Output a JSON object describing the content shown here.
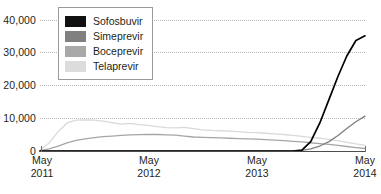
{
  "chart_data": {
    "type": "line",
    "title": "",
    "xlabel": "",
    "ylabel": "",
    "ylim": [
      0,
      44000
    ],
    "yticks": [
      0,
      10000,
      20000,
      30000,
      40000
    ],
    "ytick_labels": [
      "0",
      "10,000",
      "20,000",
      "30,000",
      "40,000"
    ],
    "grid": true,
    "xlim": [
      "May 2011",
      "May 2014"
    ],
    "xticks": [
      "May 2011",
      "May 2012",
      "May 2013",
      "May 2014"
    ],
    "xtick_labels": [
      {
        "month": "May",
        "year": "2011"
      },
      {
        "month": "May",
        "year": "2012"
      },
      {
        "month": "May",
        "year": "2013"
      },
      {
        "month": "May",
        "year": "2014"
      }
    ],
    "legend_position": "upper-left-inside",
    "x": [
      0,
      0.028,
      0.056,
      0.083,
      0.111,
      0.139,
      0.167,
      0.194,
      0.222,
      0.25,
      0.278,
      0.306,
      0.333,
      0.361,
      0.389,
      0.417,
      0.444,
      0.472,
      0.5,
      0.528,
      0.556,
      0.583,
      0.611,
      0.639,
      0.667,
      0.694,
      0.722,
      0.75,
      0.778,
      0.806,
      0.833,
      0.861,
      0.889,
      0.917,
      0.944,
      0.972,
      1.0
    ],
    "series": [
      {
        "name": "Sofosbuvir",
        "color": "#000000",
        "values": [
          0,
          0,
          0,
          0,
          0,
          0,
          0,
          0,
          0,
          0,
          0,
          0,
          0,
          0,
          0,
          0,
          0,
          0,
          0,
          0,
          0,
          0,
          0,
          0,
          0,
          0,
          0,
          0,
          0,
          300,
          3000,
          9000,
          16500,
          24000,
          30500,
          35500,
          37000
        ]
      },
      {
        "name": "Simeprevir",
        "color": "#7f7f7f",
        "values": [
          0,
          0,
          0,
          0,
          0,
          0,
          0,
          0,
          0,
          0,
          0,
          0,
          0,
          0,
          0,
          0,
          0,
          0,
          0,
          0,
          0,
          0,
          0,
          0,
          0,
          0,
          0,
          0,
          0,
          200,
          700,
          1600,
          3000,
          5000,
          7200,
          9400,
          11200
        ]
      },
      {
        "name": "Boceprevir",
        "color": "#a6a6a6",
        "values": [
          150,
          700,
          1600,
          2600,
          3400,
          3900,
          4300,
          4600,
          4800,
          5000,
          5150,
          5250,
          5300,
          5300,
          5200,
          5100,
          4800,
          4500,
          4400,
          4300,
          4200,
          4100,
          4000,
          3900,
          3800,
          3650,
          3500,
          3300,
          3100,
          2900,
          2650,
          2400,
          2100,
          1800,
          1450,
          1100,
          800
        ]
      },
      {
        "name": "Telaprevir",
        "color": "#d9d9d9",
        "values": [
          300,
          2600,
          6200,
          9000,
          9900,
          10000,
          9900,
          9600,
          9100,
          8600,
          8900,
          8500,
          8200,
          7800,
          7500,
          7400,
          7600,
          7200,
          6800,
          6600,
          6500,
          6400,
          6200,
          6000,
          5900,
          5700,
          5500,
          5300,
          5000,
          4700,
          4400,
          4100,
          3700,
          3300,
          2800,
          2300,
          1800
        ]
      }
    ]
  },
  "legend": {
    "items": [
      {
        "label": "Sofosbuvir",
        "color": "#111111"
      },
      {
        "label": "Simeprevir",
        "color": "#808080"
      },
      {
        "label": "Boceprevir",
        "color": "#a8a8a8"
      },
      {
        "label": "Telaprevir",
        "color": "#dcdcdc"
      }
    ]
  }
}
